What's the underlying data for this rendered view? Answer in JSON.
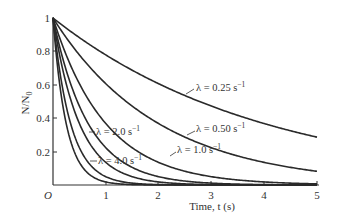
{
  "chart_data": {
    "type": "line",
    "title": "",
    "xlabel": "Time, t (s)",
    "ylabel": "N/N0",
    "xlim": [
      0,
      5
    ],
    "ylim": [
      0,
      1
    ],
    "grid": false,
    "legend_position": "inline annotations",
    "origin_label": "O",
    "x_ticks": [
      1,
      2,
      3,
      4,
      5
    ],
    "y_ticks": [
      0.2,
      0.4,
      0.6,
      0.8,
      1
    ],
    "y_tick_labels": [
      "0.2",
      "0.4",
      "0.6",
      "0.8",
      "1"
    ],
    "x_tick_labels": [
      "1",
      "2",
      "3",
      "4",
      "5"
    ],
    "function": "N/N0 = exp(-lambda * t)",
    "series": [
      {
        "name": "λ = 0.25 s⁻¹",
        "lambda": 0.25,
        "x": [
          0,
          1,
          2,
          3,
          4,
          5
        ],
        "values": [
          1.0,
          0.779,
          0.607,
          0.472,
          0.368,
          0.287
        ]
      },
      {
        "name": "λ = 0.50 s⁻¹",
        "lambda": 0.5,
        "x": [
          0,
          1,
          2,
          3,
          4,
          5
        ],
        "values": [
          1.0,
          0.607,
          0.368,
          0.223,
          0.135,
          0.082
        ]
      },
      {
        "name": "λ = 1.0 s⁻¹",
        "lambda": 1.0,
        "x": [
          0,
          1,
          2,
          3,
          4,
          5
        ],
        "values": [
          1.0,
          0.368,
          0.135,
          0.05,
          0.018,
          0.007
        ]
      },
      {
        "name": "λ = 2.0 s⁻¹",
        "lambda": 2.0,
        "x": [
          0,
          1,
          2,
          3,
          4,
          5
        ],
        "values": [
          1.0,
          0.135,
          0.018,
          0.002,
          0.0003,
          5e-05
        ]
      },
      {
        "name": "λ = 4.0 s⁻¹",
        "lambda": 4.0,
        "x": [
          0,
          1,
          2,
          3,
          4,
          5
        ],
        "values": [
          1.0,
          0.018,
          0.0003,
          0.0,
          0.0,
          0.0
        ]
      }
    ],
    "extra_curves_unlabeled": [
      {
        "lambda": 1.5
      },
      {
        "lambda": 3.0
      }
    ]
  },
  "labels": {
    "y_axis": "N/N",
    "y_axis_sub": "0",
    "x_axis": "Time, t (s)",
    "origin": "O",
    "l025": "λ = 0.25 s",
    "l050": "λ = 0.50 s",
    "l10": "λ = 1.0 s",
    "l20": "λ = 2.0 s",
    "l40": "λ = 4.0 s",
    "unit_exp": "−1"
  },
  "colors": {
    "line": "#2a2a2a",
    "axis": "#333333",
    "background": "#ffffff"
  }
}
